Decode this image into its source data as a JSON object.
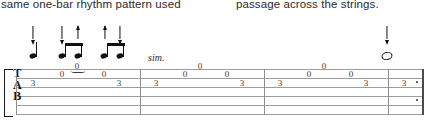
{
  "prose": {
    "left_column": "same one-bar rhythm pattern used",
    "right_column": "passage across the strings."
  },
  "notation": {
    "system_label": "guitar-tablature-system",
    "clef": {
      "letters": [
        "T",
        "A",
        "B"
      ]
    },
    "expression": {
      "sim": "sim."
    },
    "staff": {
      "line_count": 6,
      "line_color": "#9d9d9d"
    },
    "ink_color": "#111111",
    "strokes": [
      {
        "dir": "down",
        "x": 33
      },
      {
        "dir": "down",
        "x": 62
      },
      {
        "dir": "up",
        "x": 78
      },
      {
        "dir": "up",
        "x": 105
      },
      {
        "dir": "down",
        "x": 119
      },
      {
        "dir": "down",
        "x": 387
      }
    ],
    "measures": [
      {
        "index": 1,
        "barline_x": 16,
        "fret_marks": [
          {
            "fret": "3",
            "x": 33,
            "string": 5
          },
          {
            "fret": "0",
            "x": 62,
            "string": 4
          },
          {
            "fret": "0",
            "x": 77,
            "string": 3
          },
          {
            "fret": "0",
            "x": 104,
            "string": 4
          },
          {
            "fret": "3",
            "x": 119,
            "string": 5
          }
        ]
      },
      {
        "index": 2,
        "barline_x": 140,
        "fret_marks": [
          {
            "fret": "3",
            "x": 156,
            "string": 5
          },
          {
            "fret": "0",
            "x": 185,
            "string": 4
          },
          {
            "fret": "0",
            "x": 200,
            "string": 3
          },
          {
            "fret": "0",
            "x": 227,
            "string": 4
          },
          {
            "fret": "3",
            "x": 242,
            "string": 5
          }
        ]
      },
      {
        "index": 3,
        "barline_x": 264,
        "fret_marks": [
          {
            "fret": "3",
            "x": 280,
            "string": 5
          },
          {
            "fret": "0",
            "x": 309,
            "string": 4
          },
          {
            "fret": "0",
            "x": 324,
            "string": 3
          },
          {
            "fret": "0",
            "x": 351,
            "string": 4
          },
          {
            "fret": "3",
            "x": 366,
            "string": 5
          }
        ]
      },
      {
        "index": 4,
        "barline_x": 388,
        "fret_marks": [
          {
            "fret": "3",
            "x": 404,
            "string": 5
          }
        ],
        "ending": "repeat-end"
      }
    ],
    "rhythm": {
      "measure1": [
        "quarter",
        "eighth",
        "eighth",
        "eighth",
        "eighth"
      ],
      "measure4": [
        "whole"
      ]
    }
  }
}
